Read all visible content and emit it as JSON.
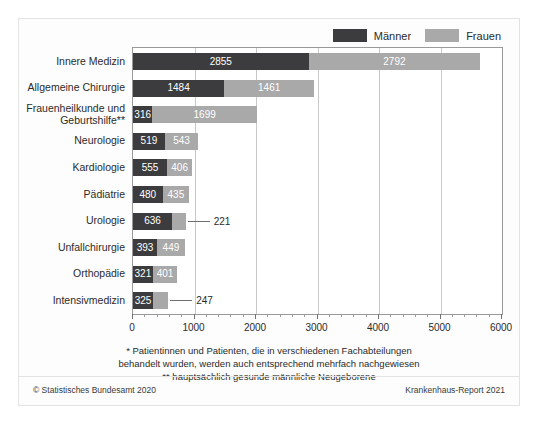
{
  "legend": {
    "entries": [
      {
        "label": "Männer",
        "color": "#3c3c3e",
        "key": "maenner"
      },
      {
        "label": "Frauen",
        "color": "#a9a9a9",
        "key": "frauen"
      }
    ]
  },
  "footnotes": {
    "line1": "* Patientinnen und Patienten, die in verschiedenen Fachabteilungen",
    "line2": "behandelt wurden, werden auch entsprechend mehrfach nachgewiesen",
    "line3": "** hauptsächlich gesunde männliche Neugeborene"
  },
  "source": {
    "copyright": "© Statistisches Bundesamt 2020",
    "report": "Krankenhaus-Report 2021"
  },
  "chart_data": {
    "type": "bar",
    "orientation": "horizontal",
    "stacked": true,
    "title": "",
    "xlabel": "",
    "ylabel": "",
    "xlim": [
      0,
      6000
    ],
    "xticks": [
      0,
      1000,
      2000,
      3000,
      4000,
      5000,
      6000
    ],
    "xticklabels": [
      "0",
      "1000",
      "2000",
      "3000",
      "4000",
      "5000",
      "6000"
    ],
    "minor_tick_step": 200,
    "grid": true,
    "grid_axis": "x",
    "legend_position": "top-right",
    "categories": [
      "Innere Medizin",
      "Allgemeine Chirurgie",
      "Frauenheilkunde und Geburtshilfe**",
      "Neurologie",
      "Kardiologie",
      "Pädiatrie",
      "Urologie",
      "Unfallchirurgie",
      "Orthopädie",
      "Intensivmedizin"
    ],
    "series": [
      {
        "name": "Männer",
        "color": "#3c3c3e",
        "values": [
          2855,
          1484,
          316,
          519,
          555,
          480,
          636,
          393,
          321,
          325
        ]
      },
      {
        "name": "Frauen",
        "color": "#a9a9a9",
        "values": [
          2792,
          1461,
          1699,
          543,
          406,
          435,
          221,
          449,
          401,
          247
        ]
      }
    ],
    "label_placement": [
      {
        "category": "Innere Medizin",
        "maenner": "inside",
        "frauen": "inside"
      },
      {
        "category": "Allgemeine Chirurgie",
        "maenner": "inside",
        "frauen": "inside"
      },
      {
        "category": "Frauenheilkunde und Geburtshilfe**",
        "maenner": "inside",
        "frauen": "inside"
      },
      {
        "category": "Neurologie",
        "maenner": "inside",
        "frauen": "inside"
      },
      {
        "category": "Kardiologie",
        "maenner": "inside",
        "frauen": "inside"
      },
      {
        "category": "Pädiatrie",
        "maenner": "inside",
        "frauen": "inside"
      },
      {
        "category": "Urologie",
        "maenner": "inside",
        "frauen": "outside"
      },
      {
        "category": "Unfallchirurgie",
        "maenner": "inside",
        "frauen": "inside"
      },
      {
        "category": "Orthopädie",
        "maenner": "inside",
        "frauen": "inside"
      },
      {
        "category": "Intensivmedizin",
        "maenner": "inside",
        "frauen": "outside"
      }
    ]
  }
}
